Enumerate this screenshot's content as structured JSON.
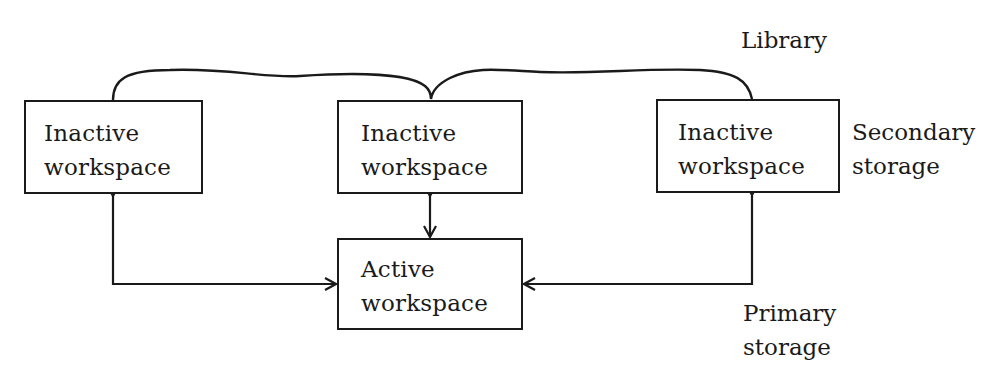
{
  "diagram": {
    "library_label": "Library",
    "secondary_storage_label": [
      "Secondary",
      "storage"
    ],
    "primary_storage_label": [
      "Primary",
      "storage"
    ],
    "nodes": [
      {
        "id": "inactive-1",
        "lines": [
          "Inactive",
          "workspace"
        ]
      },
      {
        "id": "inactive-2",
        "lines": [
          "Inactive",
          "workspace"
        ]
      },
      {
        "id": "inactive-3",
        "lines": [
          "Inactive",
          "workspace"
        ]
      },
      {
        "id": "active",
        "lines": [
          "Active",
          "workspace"
        ]
      }
    ],
    "edges": [
      {
        "from": "inactive-1",
        "to": "active",
        "direction": "bidirectional"
      },
      {
        "from": "inactive-2",
        "to": "active",
        "direction": "bidirectional"
      },
      {
        "from": "inactive-3",
        "to": "active",
        "direction": "bidirectional"
      }
    ],
    "groups": [
      {
        "label": "Library",
        "members": [
          "inactive-1",
          "inactive-2",
          "inactive-3"
        ]
      }
    ],
    "colors": {
      "line": "#1a1a1a",
      "background": "#ffffff"
    }
  }
}
